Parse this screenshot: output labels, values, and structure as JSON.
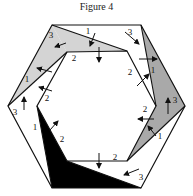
{
  "title": "Figure 4",
  "colors": {
    "light_gray": "#d4d4d4",
    "mid_gray": "#a9a9a9",
    "black": "#000000",
    "line": "#111111"
  },
  "outer_hexagon": [
    [
      52,
      25
    ],
    [
      141,
      25
    ],
    [
      185,
      106
    ],
    [
      141,
      188
    ],
    [
      52,
      188
    ],
    [
      8,
      106
    ]
  ],
  "inner_hexagon": [
    [
      67,
      52
    ],
    [
      127,
      51
    ],
    [
      156,
      106
    ],
    [
      127,
      161
    ],
    [
      67,
      161
    ],
    [
      37,
      106
    ]
  ],
  "regions": [
    {
      "name": "top-left-light",
      "fill": "light_gray",
      "points": [
        [
          52,
          25
        ],
        [
          127,
          51
        ],
        [
          67,
          52
        ]
      ]
    },
    {
      "name": "left-light",
      "fill": "light_gray",
      "points": [
        [
          52,
          25
        ],
        [
          67,
          52
        ],
        [
          8,
          106
        ]
      ]
    },
    {
      "name": "right-mid",
      "fill": "mid_gray",
      "points": [
        [
          141,
          25
        ],
        [
          185,
          106
        ],
        [
          156,
          106
        ]
      ]
    },
    {
      "name": "bottom-right-mid",
      "fill": "mid_gray",
      "points": [
        [
          127,
          161
        ],
        [
          156,
          106
        ],
        [
          185,
          106
        ]
      ]
    },
    {
      "name": "bottom-black",
      "fill": "black",
      "points": [
        [
          37,
          106
        ],
        [
          67,
          161
        ],
        [
          141,
          188
        ],
        [
          52,
          188
        ]
      ]
    }
  ],
  "extra_lines": [
    [
      [
        52,
        25
      ],
      [
        127,
        51
      ]
    ],
    [
      [
        67,
        52
      ],
      [
        8,
        106
      ]
    ],
    [
      [
        141,
        25
      ],
      [
        156,
        106
      ]
    ],
    [
      [
        127,
        161
      ],
      [
        185,
        106
      ]
    ],
    [
      [
        67,
        161
      ],
      [
        141,
        188
      ]
    ],
    [
      [
        37,
        106
      ],
      [
        52,
        188
      ]
    ]
  ],
  "labels": [
    {
      "text": "3",
      "x": 51,
      "y": 38
    },
    {
      "text": "1",
      "x": 88,
      "y": 34
    },
    {
      "text": "3",
      "x": 130,
      "y": 35
    },
    {
      "text": "2",
      "x": 74,
      "y": 61
    },
    {
      "text": "2",
      "x": 130,
      "y": 75
    },
    {
      "text": "1",
      "x": 153,
      "y": 73
    },
    {
      "text": "1",
      "x": 27,
      "y": 82
    },
    {
      "text": "2",
      "x": 47,
      "y": 101
    },
    {
      "text": "3",
      "x": 15,
      "y": 115
    },
    {
      "text": "3",
      "x": 175,
      "y": 103
    },
    {
      "text": "2",
      "x": 145,
      "y": 112
    },
    {
      "text": "1",
      "x": 35,
      "y": 130
    },
    {
      "text": "2",
      "x": 62,
      "y": 142
    },
    {
      "text": "1",
      "x": 160,
      "y": 139
    },
    {
      "text": "2",
      "x": 115,
      "y": 160
    },
    {
      "text": "3",
      "x": 141,
      "y": 180
    }
  ],
  "arrows": [
    {
      "x1": 66,
      "y1": 43,
      "x2": 55,
      "y2": 47
    },
    {
      "x1": 95,
      "y1": 33,
      "x2": 90,
      "y2": 46
    },
    {
      "x1": 125,
      "y1": 32,
      "x2": 139,
      "y2": 44
    },
    {
      "x1": 99,
      "y1": 47,
      "x2": 99,
      "y2": 62
    },
    {
      "x1": 139,
      "y1": 59,
      "x2": 157,
      "y2": 59
    },
    {
      "x1": 137,
      "y1": 86,
      "x2": 149,
      "y2": 74
    },
    {
      "x1": 52,
      "y1": 72,
      "x2": 37,
      "y2": 68
    },
    {
      "x1": 52,
      "y1": 91,
      "x2": 39,
      "y2": 87
    },
    {
      "x1": 24,
      "y1": 110,
      "x2": 24,
      "y2": 97
    },
    {
      "x1": 168,
      "y1": 114,
      "x2": 168,
      "y2": 98
    },
    {
      "x1": 154,
      "y1": 119,
      "x2": 138,
      "y2": 119
    },
    {
      "x1": 156,
      "y1": 136,
      "x2": 148,
      "y2": 126
    },
    {
      "x1": 50,
      "y1": 130,
      "x2": 58,
      "y2": 121
    },
    {
      "x1": 99,
      "y1": 153,
      "x2": 99,
      "y2": 168
    },
    {
      "x1": 139,
      "y1": 169,
      "x2": 124,
      "y2": 175
    }
  ]
}
